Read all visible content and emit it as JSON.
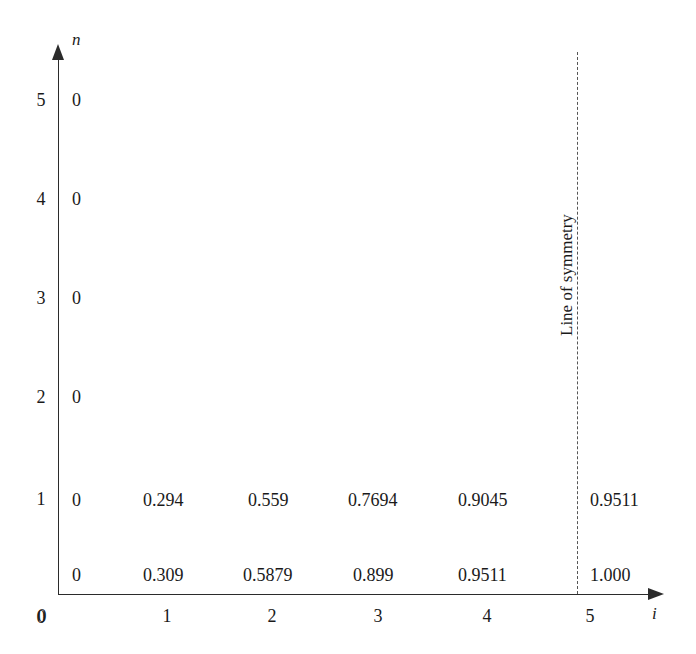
{
  "figure": {
    "background_color": "#ffffff",
    "ink_color": "#1a1a1a",
    "axis_color": "#2b2b2b",
    "dash_color": "#555555"
  },
  "axes": {
    "y_name": "n",
    "x_name": "i",
    "y_ticks": [
      "0",
      "1",
      "2",
      "3",
      "4",
      "5"
    ],
    "x_ticks": [
      "0",
      "1",
      "2",
      "3",
      "4",
      "5"
    ]
  },
  "annotation": {
    "symmetry_label": "Line of symmetry",
    "symmetry_at_i": "5"
  },
  "chart_data": {
    "type": "table",
    "title": "",
    "xlabel": "i",
    "ylabel": "n",
    "xlim": [
      0,
      5
    ],
    "ylim": [
      0,
      5
    ],
    "grid": false,
    "legend": "none",
    "x": [
      0,
      1,
      2,
      3,
      4,
      5
    ],
    "y": [
      0,
      1,
      2,
      3,
      4,
      5
    ],
    "annotations": [
      {
        "text": "Line of symmetry",
        "at_x": 5,
        "orientation": "vertical",
        "style": "dashed"
      }
    ],
    "rows": [
      {
        "n": "5",
        "values": [
          "0",
          "",
          "",
          "",
          "",
          ""
        ]
      },
      {
        "n": "4",
        "values": [
          "0",
          "",
          "",
          "",
          "",
          ""
        ]
      },
      {
        "n": "3",
        "values": [
          "0",
          "",
          "",
          "",
          "",
          ""
        ]
      },
      {
        "n": "2",
        "values": [
          "0",
          "",
          "",
          "",
          "",
          ""
        ]
      },
      {
        "n": "1",
        "values": [
          "0",
          "0.294",
          "0.559",
          "0.7694",
          "0.9045",
          "0.9511"
        ]
      },
      {
        "n": "0",
        "values": [
          "0",
          "0.309",
          "0.5879",
          "0.899",
          "0.9511",
          "1.000"
        ]
      }
    ]
  },
  "cells": [
    {
      "id": "c-n5-i0",
      "text": "0",
      "x": 72,
      "y": 100
    },
    {
      "id": "c-n4-i0",
      "text": "0",
      "x": 72,
      "y": 199
    },
    {
      "id": "c-n3-i0",
      "text": "0",
      "x": 72,
      "y": 298
    },
    {
      "id": "c-n2-i0",
      "text": "0",
      "x": 72,
      "y": 397
    },
    {
      "id": "c-n1-i0",
      "text": "0",
      "x": 72,
      "y": 500
    },
    {
      "id": "c-n1-i1",
      "text": "0.294",
      "x": 143,
      "y": 500
    },
    {
      "id": "c-n1-i2",
      "text": "0.559",
      "x": 248,
      "y": 500
    },
    {
      "id": "c-n1-i3",
      "text": "0.7694",
      "x": 348,
      "y": 500
    },
    {
      "id": "c-n1-i4",
      "text": "0.9045",
      "x": 458,
      "y": 500
    },
    {
      "id": "c-n1-i5",
      "text": "0.9511",
      "x": 590,
      "y": 500
    },
    {
      "id": "c-n0-i0",
      "text": "0",
      "x": 72,
      "y": 575
    },
    {
      "id": "c-n0-i1",
      "text": "0.309",
      "x": 143,
      "y": 575
    },
    {
      "id": "c-n0-i2",
      "text": "0.5879",
      "x": 243,
      "y": 575
    },
    {
      "id": "c-n0-i3",
      "text": "0.899",
      "x": 353,
      "y": 575
    },
    {
      "id": "c-n0-i4",
      "text": "0.9511",
      "x": 458,
      "y": 575
    },
    {
      "id": "c-n0-i5",
      "text": "1.000",
      "x": 590,
      "y": 575
    }
  ],
  "tick_positions": {
    "y": [
      {
        "label": "5",
        "top": 100
      },
      {
        "label": "4",
        "top": 199
      },
      {
        "label": "3",
        "top": 298
      },
      {
        "label": "2",
        "top": 397
      },
      {
        "label": "1",
        "top": 499
      },
      {
        "label": "0",
        "top": 617
      }
    ],
    "x": [
      {
        "label": "0",
        "left": 42
      },
      {
        "label": "1",
        "left": 167
      },
      {
        "label": "2",
        "left": 272
      },
      {
        "label": "3",
        "left": 378
      },
      {
        "label": "4",
        "left": 487
      },
      {
        "label": "5",
        "left": 590
      }
    ]
  }
}
